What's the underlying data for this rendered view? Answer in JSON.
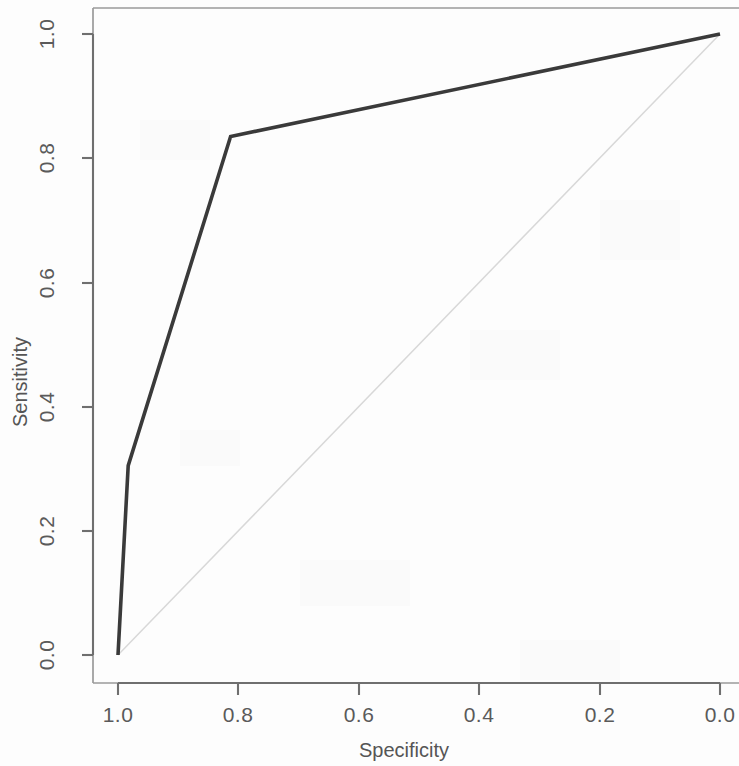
{
  "chart_data": {
    "type": "line",
    "title": "",
    "subtitle": "",
    "xlabel": "Specificity",
    "ylabel": "Sensitivity",
    "xlim": [
      1.0,
      0.0
    ],
    "ylim": [
      0.0,
      1.0
    ],
    "x_axis_reversed": true,
    "grid": false,
    "legend": null,
    "legend_position": "none",
    "xticks": [
      "1.0",
      "0.8",
      "0.6",
      "0.4",
      "0.2",
      "0.0"
    ],
    "xtick_values": [
      1.0,
      0.8,
      0.6,
      0.4,
      0.2,
      0.0
    ],
    "yticks": [
      "0.0",
      "0.2",
      "0.4",
      "0.6",
      "0.8",
      "1.0"
    ],
    "ytick_values": [
      0.0,
      0.2,
      0.4,
      0.6,
      0.8,
      1.0
    ],
    "series": [
      {
        "name": "ROC curve",
        "color": "#3a3a3a",
        "x": [
          1.0,
          0.983,
          0.813,
          0.0
        ],
        "y": [
          0.0,
          0.305,
          0.835,
          1.0
        ],
        "points": [
          {
            "specificity": 1.0,
            "sensitivity": 0.0
          },
          {
            "specificity": 0.983,
            "sensitivity": 0.305
          },
          {
            "specificity": 0.813,
            "sensitivity": 0.835
          },
          {
            "specificity": 0.0,
            "sensitivity": 1.0
          }
        ]
      },
      {
        "name": "Chance diagonal",
        "color": "#d8d8d8",
        "x": [
          1.0,
          0.0
        ],
        "y": [
          0.0,
          1.0
        ],
        "points": [
          {
            "specificity": 1.0,
            "sensitivity": 0.0
          },
          {
            "specificity": 0.0,
            "sensitivity": 1.0
          }
        ]
      }
    ],
    "annotations": []
  },
  "figure": {
    "background_color": "#fdfdfd",
    "axis_color": "#6f6f6f",
    "curve_color": "#3a3a3a",
    "reference_line_color": "#d8d8d8",
    "plot_box_color": "#9a9a9a"
  }
}
